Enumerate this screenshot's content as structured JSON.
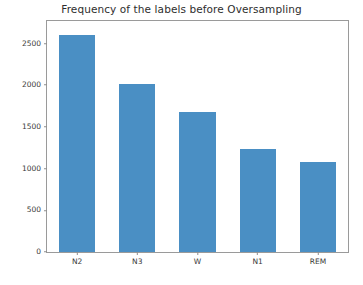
{
  "chart_data": {
    "type": "bar",
    "title": "Frequency of the labels before Oversampling",
    "xlabel": "",
    "ylabel": "",
    "categories": [
      "N2",
      "N3",
      "W",
      "N1",
      "REM"
    ],
    "values": [
      2600,
      2020,
      1680,
      1230,
      1085
    ],
    "yticks": [
      0,
      500,
      1000,
      1500,
      2000,
      2500
    ],
    "ytick_labels": [
      "0",
      "500",
      "1000",
      "1500",
      "2000",
      "2500"
    ],
    "ylim": [
      0,
      2770
    ],
    "grid": false,
    "legend": null,
    "bar_color": "#4a8fc4",
    "bar_width_ratio": 0.6,
    "frame_color": "#9a9a9a",
    "background": "#ffffff",
    "series": [
      {
        "name": "frequency",
        "values": [
          2600,
          2020,
          1680,
          1230,
          1085
        ]
      }
    ]
  }
}
